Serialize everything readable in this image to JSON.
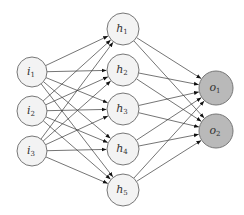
{
  "diagram": {
    "type": "feedforward-neural-network",
    "colors": {
      "edge": "#3a3a3a",
      "node_stroke": "#777777",
      "input_fill": "#f3f3f3",
      "hidden_fill": "#f3f3f3",
      "output_fill": "#b9b9b9"
    },
    "layers": [
      {
        "name": "input",
        "x": 32,
        "radius": 15,
        "nodes": [
          {
            "id": "i1",
            "base": "i",
            "sub": "1",
            "y": 72
          },
          {
            "id": "i2",
            "base": "i",
            "sub": "2",
            "y": 111
          },
          {
            "id": "i3",
            "base": "i",
            "sub": "3",
            "y": 151
          }
        ]
      },
      {
        "name": "hidden",
        "x": 123,
        "radius": 16,
        "nodes": [
          {
            "id": "h1",
            "base": "h",
            "sub": "1",
            "y": 29
          },
          {
            "id": "h2",
            "base": "h",
            "sub": "2",
            "y": 70
          },
          {
            "id": "h3",
            "base": "h",
            "sub": "3",
            "y": 109
          },
          {
            "id": "h4",
            "base": "h",
            "sub": "4",
            "y": 149
          },
          {
            "id": "h5",
            "base": "h",
            "sub": "5",
            "y": 190
          }
        ]
      },
      {
        "name": "output",
        "x": 216,
        "radius": 17,
        "nodes": [
          {
            "id": "o1",
            "base": "o",
            "sub": "1",
            "y": 88
          },
          {
            "id": "o2",
            "base": "o",
            "sub": "2",
            "y": 131
          }
        ]
      }
    ],
    "connections": "fully-connected between consecutive layers, arrows pointing toward next layer"
  }
}
